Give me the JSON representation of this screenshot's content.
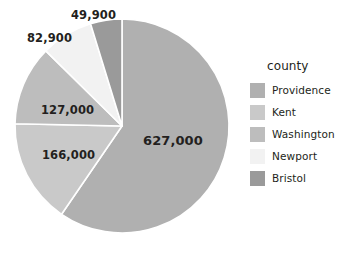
{
  "chart_data": {
    "type": "pie",
    "title": "",
    "legend_title": "county",
    "legend_position": "right",
    "categories": [
      "Providence",
      "Kent",
      "Washington",
      "Newport",
      "Bristol"
    ],
    "values": [
      627000,
      166000,
      127000,
      82900,
      49900
    ],
    "labels": [
      "627,000",
      "166,000",
      "127,000",
      "82,900",
      "49,900"
    ],
    "total": 1052800,
    "start_angle_deg": 0,
    "direction": "clockwise",
    "colors": [
      "#b0b0b0",
      "#c9c9c9",
      "#bdbdbd",
      "#f2f2f2",
      "#9a9a9a"
    ],
    "slices": [
      {
        "name": "Providence",
        "value": 627000,
        "label": "627,000",
        "color": "#b0b0b0",
        "percent": 59.6,
        "start_deg": 0.0,
        "sweep_deg": 214.4
      },
      {
        "name": "Kent",
        "value": 166000,
        "label": "166,000",
        "color": "#c9c9c9",
        "percent": 15.8,
        "start_deg": 214.4,
        "sweep_deg": 56.8
      },
      {
        "name": "Washington",
        "value": 127000,
        "label": "127,000",
        "color": "#bdbdbd",
        "percent": 12.1,
        "start_deg": 271.2,
        "sweep_deg": 43.4
      },
      {
        "name": "Newport",
        "value": 82900,
        "label": "82,900",
        "color": "#f2f2f2",
        "percent": 7.9,
        "start_deg": 314.6,
        "sweep_deg": 28.3
      },
      {
        "name": "Bristol",
        "value": 49900,
        "label": "49,900",
        "color": "#9a9a9a",
        "percent": 4.7,
        "start_deg": 342.9,
        "sweep_deg": 17.1
      }
    ],
    "xlabel": "",
    "ylabel": ""
  },
  "geometry": {
    "center_x": 122,
    "center_y": 126,
    "radius": 107,
    "separator_color": "#ffffff",
    "separator_width": 1.6
  },
  "labels_layout": [
    {
      "key": "providence",
      "text": "627,000",
      "left": 143,
      "top": 134,
      "size": "big"
    },
    {
      "key": "kent",
      "text": "166,000",
      "left": 42,
      "top": 150,
      "size": "small"
    },
    {
      "key": "washington",
      "text": "127,000",
      "left": 41,
      "top": 105,
      "size": "small"
    },
    {
      "key": "newport",
      "text": "82,900",
      "left": 27,
      "top": 33,
      "size": "small"
    },
    {
      "key": "bristol",
      "text": "49,900",
      "left": 71,
      "top": 10,
      "size": "small"
    }
  ],
  "legend": {
    "title": "county",
    "items": [
      {
        "label": "Providence",
        "color": "#b0b0b0"
      },
      {
        "label": "Kent",
        "color": "#c9c9c9"
      },
      {
        "label": "Washington",
        "color": "#bdbdbd"
      },
      {
        "label": "Newport",
        "color": "#f2f2f2"
      },
      {
        "label": "Bristol",
        "color": "#9a9a9a"
      }
    ]
  },
  "background": "#ffffff"
}
